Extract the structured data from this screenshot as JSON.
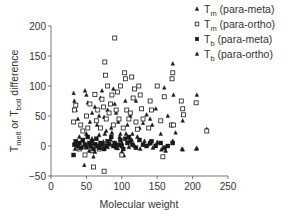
{
  "chart_data": {
    "type": "scatter",
    "title": "",
    "xlabel": "Molecular weight",
    "ylabel": "T_melt or T_boil difference",
    "ylabel_parts": {
      "t1": "T",
      "s1": "melt",
      "mid": " or T",
      "s2": "boil",
      "end": " difference"
    },
    "xlim": [
      0,
      250
    ],
    "ylim": [
      -50,
      200
    ],
    "xticks": [
      0,
      50,
      100,
      150,
      200,
      250
    ],
    "yticks": [
      -50,
      0,
      50,
      100,
      150,
      200
    ],
    "grid": false,
    "legend_position": "top-right",
    "series": [
      {
        "name": "Tm (para-meta)",
        "label_main": "T",
        "label_sub": "m",
        "label_rest": " (para-meta)",
        "marker": "triangle",
        "points": [
          [
            32,
            88
          ],
          [
            33,
            75
          ],
          [
            35,
            60
          ],
          [
            38,
            45
          ],
          [
            47,
            -32
          ],
          [
            48,
            92
          ],
          [
            50,
            85
          ],
          [
            52,
            72
          ],
          [
            55,
            40
          ],
          [
            58,
            55
          ],
          [
            60,
            -18
          ],
          [
            62,
            65
          ],
          [
            65,
            35
          ],
          [
            68,
            50
          ],
          [
            70,
            80
          ],
          [
            72,
            92
          ],
          [
            75,
            48
          ],
          [
            78,
            25
          ],
          [
            80,
            60
          ],
          [
            85,
            30
          ],
          [
            88,
            95
          ],
          [
            90,
            70
          ],
          [
            92,
            55
          ],
          [
            95,
            40
          ],
          [
            98,
            20
          ],
          [
            100,
            -10
          ],
          [
            103,
            -16
          ],
          [
            105,
            75
          ],
          [
            108,
            35
          ],
          [
            112,
            50
          ],
          [
            115,
            20
          ],
          [
            120,
            75
          ],
          [
            125,
            30
          ],
          [
            130,
            38
          ],
          [
            135,
            52
          ],
          [
            140,
            45
          ],
          [
            143,
            35
          ],
          [
            148,
            62
          ],
          [
            155,
            20
          ],
          [
            160,
            97
          ],
          [
            165,
            50
          ],
          [
            172,
            137
          ],
          [
            173,
            85
          ],
          [
            176,
            22
          ],
          [
            185,
            -5
          ],
          [
            186,
            42
          ],
          [
            205,
            -5
          ],
          [
            206,
            85
          ],
          [
            220,
            28
          ]
        ]
      },
      {
        "name": "Tm (para-ortho)",
        "label_main": "T",
        "label_sub": "m",
        "label_rest": " (para-ortho)",
        "marker": "open-square",
        "points": [
          [
            32,
            40
          ],
          [
            33,
            60
          ],
          [
            35,
            68
          ],
          [
            40,
            -5
          ],
          [
            42,
            35
          ],
          [
            45,
            25
          ],
          [
            48,
            -15
          ],
          [
            50,
            50
          ],
          [
            52,
            30
          ],
          [
            55,
            70
          ],
          [
            58,
            -8
          ],
          [
            60,
            -35
          ],
          [
            62,
            86
          ],
          [
            64,
            42
          ],
          [
            66,
            60
          ],
          [
            68,
            -5
          ],
          [
            70,
            30
          ],
          [
            72,
            78
          ],
          [
            74,
            65
          ],
          [
            75,
            -42
          ],
          [
            76,
            140
          ],
          [
            77,
            118
          ],
          [
            78,
            45
          ],
          [
            80,
            100
          ],
          [
            82,
            55
          ],
          [
            84,
            70
          ],
          [
            86,
            85
          ],
          [
            88,
            35
          ],
          [
            90,
            180
          ],
          [
            92,
            60
          ],
          [
            94,
            90
          ],
          [
            96,
            45
          ],
          [
            98,
            100
          ],
          [
            100,
            -15
          ],
          [
            102,
            30
          ],
          [
            104,
            122
          ],
          [
            105,
            112
          ],
          [
            107,
            60
          ],
          [
            110,
            45
          ],
          [
            112,
            55
          ],
          [
            114,
            115
          ],
          [
            116,
            80
          ],
          [
            118,
            95
          ],
          [
            120,
            40
          ],
          [
            122,
            28
          ],
          [
            124,
            100
          ],
          [
            126,
            85
          ],
          [
            128,
            62
          ],
          [
            130,
            45
          ],
          [
            138,
            30
          ],
          [
            140,
            75
          ],
          [
            142,
            60
          ],
          [
            150,
            100
          ],
          [
            155,
            42
          ],
          [
            158,
            -18
          ],
          [
            160,
            82
          ],
          [
            170,
            35
          ],
          [
            171,
            112
          ],
          [
            172,
            122
          ],
          [
            173,
            35
          ],
          [
            184,
            75
          ],
          [
            186,
            62
          ],
          [
            187,
            52
          ],
          [
            205,
            72
          ],
          [
            220,
            25
          ]
        ]
      },
      {
        "name": "Tb (para-meta)",
        "label_main": "T",
        "label_sub": "b",
        "label_rest": " (para-meta)",
        "marker": "filled-square",
        "points": [
          [
            32,
            -15
          ],
          [
            33,
            2
          ],
          [
            35,
            8
          ],
          [
            38,
            0
          ],
          [
            40,
            5
          ],
          [
            42,
            -3
          ],
          [
            45,
            10
          ],
          [
            48,
            2
          ],
          [
            50,
            -2
          ],
          [
            52,
            15
          ],
          [
            54,
            5
          ],
          [
            56,
            0
          ],
          [
            58,
            8
          ],
          [
            60,
            -5
          ],
          [
            62,
            3
          ],
          [
            64,
            12
          ],
          [
            66,
            0
          ],
          [
            68,
            -3
          ],
          [
            70,
            5
          ],
          [
            72,
            2
          ],
          [
            75,
            -5
          ],
          [
            78,
            0
          ],
          [
            80,
            8
          ],
          [
            82,
            3
          ],
          [
            85,
            15
          ],
          [
            88,
            0
          ],
          [
            90,
            5
          ],
          [
            92,
            -2
          ],
          [
            95,
            2
          ],
          [
            98,
            10
          ],
          [
            100,
            0
          ],
          [
            102,
            -5
          ],
          [
            105,
            12
          ],
          [
            108,
            5
          ],
          [
            110,
            15
          ],
          [
            112,
            8
          ],
          [
            115,
            2
          ],
          [
            120,
            -3
          ],
          [
            125,
            10
          ],
          [
            130,
            2
          ],
          [
            135,
            0
          ],
          [
            140,
            5
          ],
          [
            142,
            8
          ],
          [
            148,
            0
          ],
          [
            155,
            5
          ],
          [
            160,
            -3
          ],
          [
            165,
            0
          ],
          [
            172,
            5
          ]
        ]
      },
      {
        "name": "Tb (para-ortho)",
        "label_main": "T",
        "label_sub": "b",
        "label_rest": " (para-ortho)",
        "marker": "filled-triangle",
        "points": [
          [
            34,
            -5
          ],
          [
            36,
            3
          ],
          [
            40,
            15
          ],
          [
            44,
            -2
          ],
          [
            46,
            8
          ],
          [
            50,
            20
          ],
          [
            54,
            -8
          ],
          [
            56,
            5
          ],
          [
            58,
            12
          ],
          [
            62,
            -10
          ],
          [
            65,
            2
          ],
          [
            68,
            18
          ],
          [
            70,
            -3
          ],
          [
            74,
            7
          ],
          [
            76,
            20
          ],
          [
            80,
            -2
          ],
          [
            84,
            10
          ],
          [
            86,
            22
          ],
          [
            90,
            3
          ],
          [
            94,
            -4
          ],
          [
            97,
            15
          ],
          [
            100,
            5
          ],
          [
            106,
            20
          ],
          [
            110,
            -2
          ],
          [
            114,
            10
          ],
          [
            118,
            0
          ],
          [
            122,
            15
          ],
          [
            126,
            -5
          ],
          [
            132,
            8
          ],
          [
            138,
            3
          ],
          [
            144,
            -3
          ],
          [
            150,
            6
          ],
          [
            156,
            -6
          ],
          [
            162,
            -8
          ],
          [
            172,
            8
          ],
          [
            186,
            -6
          ],
          [
            206,
            -4
          ]
        ]
      }
    ]
  },
  "legend": {
    "items": [
      {
        "main": "T",
        "sub": "m",
        "rest": " (para-meta)",
        "marker": "triangle"
      },
      {
        "main": "T",
        "sub": "m",
        "rest": " (para-ortho)",
        "marker": "open-square"
      },
      {
        "main": "T",
        "sub": "b",
        "rest": " (para-meta)",
        "marker": "filled-square"
      },
      {
        "main": "T",
        "sub": "b",
        "rest": " (para-ortho)",
        "marker": "filled-triangle"
      }
    ]
  },
  "colors": {
    "axis": "#555555",
    "marker": "#1a1a1a",
    "text": "#333333"
  }
}
